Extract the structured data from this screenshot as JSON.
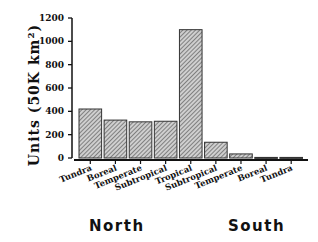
{
  "chart_data": {
    "type": "bar",
    "title": "",
    "xlabel": "",
    "ylabel": "Units (50K km²)",
    "ylim": [
      0,
      1200
    ],
    "yticks": [
      0,
      200,
      400,
      600,
      800,
      1000,
      1200
    ],
    "grid": false,
    "categories": [
      "Tundra",
      "Boreal",
      "Temperate",
      "Subtropical",
      "Tropical",
      "Subtropical",
      "Temperate",
      "Boreal",
      "Tundra"
    ],
    "values": [
      420,
      325,
      310,
      315,
      1100,
      135,
      35,
      5,
      5
    ],
    "groups": [
      {
        "label": "North",
        "categories": [
          "Tundra",
          "Boreal",
          "Temperate",
          "Subtropical"
        ]
      },
      {
        "label": "South",
        "categories": [
          "Subtropical",
          "Temperate",
          "Boreal",
          "Tundra"
        ]
      }
    ],
    "bar_fill": "hatched",
    "bar_color": "#9a9a9a"
  }
}
